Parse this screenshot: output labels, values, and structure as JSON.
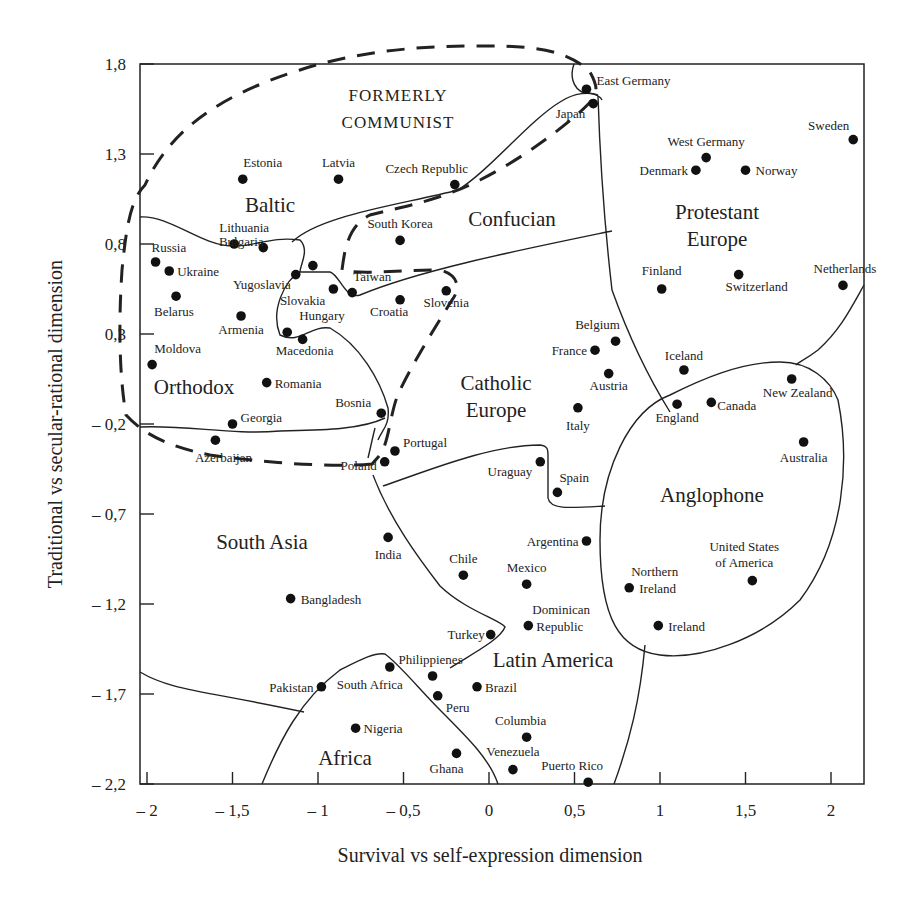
{
  "chart_data": {
    "type": "scatter",
    "title": "",
    "xlabel": "Survival vs self-expression dimension",
    "ylabel": "Traditional vs secular-rational dimension",
    "xlim": [
      -2.05,
      2.2
    ],
    "ylim": [
      -2.2,
      1.8
    ],
    "grid": false,
    "legend": "none",
    "x_ticks": [
      -2,
      -1.5,
      -1,
      -0.5,
      0,
      0.5,
      1,
      1.5,
      2
    ],
    "x_tick_labels": [
      "– 2",
      "– 1,5",
      "– 1",
      "– 0,5",
      "0",
      "0,5",
      "1",
      "1,5",
      "2"
    ],
    "y_ticks": [
      1.8,
      1.3,
      0.8,
      0.3,
      -0.2,
      -0.7,
      -1.2,
      -1.7,
      -2.2
    ],
    "y_tick_labels": [
      "1,8",
      "1,3",
      "0,8",
      "0,3",
      "– 0,2",
      "– 0,7",
      "– 1,2",
      "– 1,7",
      "– 2,2"
    ],
    "points": [
      {
        "label": "East Germany",
        "x": 0.57,
        "y": 1.66
      },
      {
        "label": "Japan",
        "x": 0.61,
        "y": 1.58
      },
      {
        "label": "Sweden",
        "x": 2.13,
        "y": 1.38
      },
      {
        "label": "West Germany",
        "x": 1.27,
        "y": 1.28
      },
      {
        "label": "Denmark",
        "x": 1.21,
        "y": 1.21
      },
      {
        "label": "Norway",
        "x": 1.5,
        "y": 1.21
      },
      {
        "label": "Estonia",
        "x": -1.44,
        "y": 1.16
      },
      {
        "label": "Latvia",
        "x": -0.88,
        "y": 1.16
      },
      {
        "label": "Czech Republic",
        "x": -0.2,
        "y": 1.13
      },
      {
        "label": "South Korea",
        "x": -0.52,
        "y": 0.82
      },
      {
        "label": "Lithuania",
        "x": -1.49,
        "y": 0.8
      },
      {
        "label": "Russia",
        "x": -1.95,
        "y": 0.7
      },
      {
        "label": "Ukraine",
        "x": -1.87,
        "y": 0.65
      },
      {
        "label": "Bulgaria",
        "x": -1.32,
        "y": 0.78
      },
      {
        "label": "Yugoslavia",
        "x": -1.13,
        "y": 0.63
      },
      {
        "label": "Unlabeled",
        "x": -1.03,
        "y": 0.68
      },
      {
        "label": "Belarus",
        "x": -1.83,
        "y": 0.51
      },
      {
        "label": "Slovakia",
        "x": -0.91,
        "y": 0.55
      },
      {
        "label": "Taiwan",
        "x": -0.8,
        "y": 0.53
      },
      {
        "label": "Croatia",
        "x": -0.52,
        "y": 0.49
      },
      {
        "label": "Slovenia",
        "x": -0.25,
        "y": 0.54
      },
      {
        "label": "Finland",
        "x": 1.01,
        "y": 0.55
      },
      {
        "label": "Switzerland",
        "x": 1.46,
        "y": 0.63
      },
      {
        "label": "Netherlands",
        "x": 2.07,
        "y": 0.57
      },
      {
        "label": "Armenia",
        "x": -1.45,
        "y": 0.4
      },
      {
        "label": "Hungary",
        "x": -1.18,
        "y": 0.31
      },
      {
        "label": "Macedonia",
        "x": -1.09,
        "y": 0.27
      },
      {
        "label": "Moldova",
        "x": -1.97,
        "y": 0.13
      },
      {
        "label": "Belgium",
        "x": 0.74,
        "y": 0.26
      },
      {
        "label": "France",
        "x": 0.62,
        "y": 0.21
      },
      {
        "label": "Austria",
        "x": 0.7,
        "y": 0.08
      },
      {
        "label": "Iceland",
        "x": 1.14,
        "y": 0.1
      },
      {
        "label": "Romania",
        "x": -1.3,
        "y": 0.03
      },
      {
        "label": "New Zealand",
        "x": 1.77,
        "y": 0.05
      },
      {
        "label": "England",
        "x": 1.1,
        "y": -0.09
      },
      {
        "label": "Canada",
        "x": 1.3,
        "y": -0.08
      },
      {
        "label": "Italy",
        "x": 0.52,
        "y": -0.11
      },
      {
        "label": "Bosnia",
        "x": -0.63,
        "y": -0.14
      },
      {
        "label": "Georgia",
        "x": -1.5,
        "y": -0.2
      },
      {
        "label": "Azerbaijan",
        "x": -1.6,
        "y": -0.29
      },
      {
        "label": "Australia",
        "x": 1.84,
        "y": -0.3
      },
      {
        "label": "Portugal",
        "x": -0.55,
        "y": -0.35
      },
      {
        "label": "Poland",
        "x": -0.61,
        "y": -0.41
      },
      {
        "label": "Uraguay",
        "x": 0.3,
        "y": -0.41
      },
      {
        "label": "Spain",
        "x": 0.4,
        "y": -0.58
      },
      {
        "label": "India",
        "x": -0.59,
        "y": -0.83
      },
      {
        "label": "Argentina",
        "x": 0.57,
        "y": -0.85
      },
      {
        "label": "Chile",
        "x": -0.15,
        "y": -1.04
      },
      {
        "label": "Mexico",
        "x": 0.22,
        "y": -1.09
      },
      {
        "label": "Northern Ireland",
        "x": 0.82,
        "y": -1.11
      },
      {
        "label": "United States of America",
        "x": 1.54,
        "y": -1.07
      },
      {
        "label": "Bangladesh",
        "x": -1.16,
        "y": -1.17
      },
      {
        "label": "Dominican Republic",
        "x": 0.23,
        "y": -1.32
      },
      {
        "label": "Ireland",
        "x": 0.99,
        "y": -1.32
      },
      {
        "label": "Turkey",
        "x": 0.01,
        "y": -1.37
      },
      {
        "label": "Philippienes",
        "x": -0.33,
        "y": -1.6
      },
      {
        "label": "South Africa",
        "x": -0.58,
        "y": -1.55
      },
      {
        "label": "Pakistan",
        "x": -0.98,
        "y": -1.66
      },
      {
        "label": "Brazil",
        "x": -0.07,
        "y": -1.66
      },
      {
        "label": "Peru",
        "x": -0.3,
        "y": -1.71
      },
      {
        "label": "Nigeria",
        "x": -0.78,
        "y": -1.89
      },
      {
        "label": "Columbia",
        "x": 0.22,
        "y": -1.94
      },
      {
        "label": "Ghana",
        "x": -0.19,
        "y": -2.03
      },
      {
        "label": "Venezuela",
        "x": 0.14,
        "y": -2.12
      },
      {
        "label": "Puerto Rico",
        "x": 0.58,
        "y": -2.19
      }
    ],
    "regions": [
      {
        "name": "FORMERLY COMMUNIST",
        "style": "dashed"
      },
      {
        "name": "Baltic",
        "style": "solid"
      },
      {
        "name": "Confucian",
        "style": "solid"
      },
      {
        "name": "Protestant Europe",
        "style": "solid"
      },
      {
        "name": "Orthodox",
        "style": "solid"
      },
      {
        "name": "Catholic Europe",
        "style": "solid"
      },
      {
        "name": "Anglophone",
        "style": "solid"
      },
      {
        "name": "South Asia",
        "style": "solid"
      },
      {
        "name": "Latin America",
        "style": "solid"
      },
      {
        "name": "Africa",
        "style": "solid"
      }
    ]
  },
  "labels": {
    "region_formerly": "FORMERLY",
    "region_communist": "COMMUNIST",
    "region_baltic": "Baltic",
    "region_confucian": "Confucian",
    "region_protestant": "Protestant",
    "region_protestant_europe": "Europe",
    "region_orthodox": "Orthodox",
    "region_catholic": "Catholic",
    "region_catholic_europe": "Europe",
    "region_anglophone": "Anglophone",
    "region_south_asia": "South Asia",
    "region_latin_america": "Latin America",
    "region_africa": "Africa"
  }
}
